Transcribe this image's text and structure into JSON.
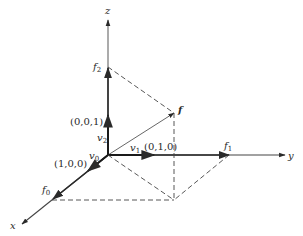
{
  "diagram": {
    "type": "3d-coordinate-vector-diagram",
    "axes": {
      "x": {
        "label": "x"
      },
      "y": {
        "label": "y"
      },
      "z": {
        "label": "z"
      }
    },
    "basis_vectors": [
      {
        "name": "v",
        "sub": "0",
        "coord": "(1,0,0)"
      },
      {
        "name": "v",
        "sub": "1",
        "coord": "(0,1,0)"
      },
      {
        "name": "v",
        "sub": "2",
        "coord": "(0,0,1)"
      }
    ],
    "points": {
      "f": {
        "label": "f"
      },
      "f0": {
        "name": "f",
        "sub": "0"
      },
      "f1": {
        "name": "f",
        "sub": "1"
      },
      "f2": {
        "name": "f",
        "sub": "2"
      }
    },
    "colors": {
      "line": "#2a2a2a",
      "axis": "#555555",
      "dashed": "#444444",
      "background": "#ffffff"
    }
  }
}
